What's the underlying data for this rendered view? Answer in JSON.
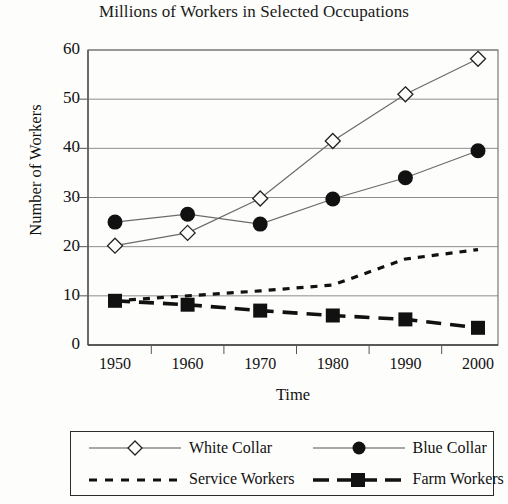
{
  "chart_data": {
    "type": "line",
    "title": "Millions of Workers in Selected Occupations",
    "xlabel": "Time",
    "ylabel": "Number of Workers",
    "categories": [
      "1950",
      "1960",
      "1970",
      "1980",
      "1990",
      "2000"
    ],
    "x": [
      1950,
      1960,
      1970,
      1980,
      1990,
      2000
    ],
    "xlim": [
      1945,
      2005
    ],
    "ylim": [
      0,
      60
    ],
    "yticks": [
      "0",
      "10",
      "20",
      "30",
      "40",
      "50",
      "60"
    ],
    "grid": "horizontal",
    "legend_position": "below-plot",
    "series": [
      {
        "name": "White Collar",
        "marker": "open-diamond",
        "line": "solid",
        "color": "#222222",
        "values": [
          20.2,
          22.8,
          29.8,
          41.5,
          51.0,
          58.2
        ]
      },
      {
        "name": "Blue Collar",
        "marker": "filled-circle",
        "line": "solid",
        "color": "#111111",
        "values": [
          25.0,
          26.6,
          24.6,
          29.7,
          34.0,
          39.5
        ]
      },
      {
        "name": "Service Workers",
        "marker": "none",
        "line": "dotted",
        "color": "#111111",
        "values": [
          9.0,
          10.0,
          11.0,
          12.2,
          17.5,
          19.4
        ]
      },
      {
        "name": "Farm Workers",
        "marker": "filled-square",
        "line": "dashed",
        "color": "#111111",
        "values": [
          9.0,
          8.2,
          7.0,
          6.0,
          5.2,
          3.5
        ]
      }
    ]
  },
  "legend": {
    "entries": [
      {
        "label": "White Collar"
      },
      {
        "label": "Blue Collar"
      },
      {
        "label": "Service Workers"
      },
      {
        "label": "Farm Workers"
      }
    ]
  }
}
